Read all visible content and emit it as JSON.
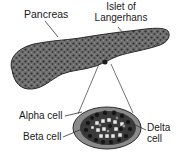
{
  "diagram": {
    "labels": {
      "pancreas": "Pancreas",
      "islet_line1": "Islet of",
      "islet_line2": "Langerhans",
      "alpha_cell": "Alpha cell",
      "beta_cell": "Beta cell",
      "delta_line1": "Delta",
      "delta_line2": "cell"
    },
    "colors": {
      "pancreas_fill": "#6e6e6e",
      "pancreas_outline": "#2a2a2a",
      "islet_fill": "#8a8a8a",
      "cell_dark": "#1c1c1c",
      "cell_light": "#e8e8e8",
      "leader_line": "#333333"
    }
  }
}
